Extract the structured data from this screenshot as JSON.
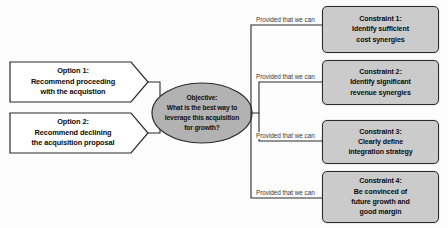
{
  "diagram": {
    "colors": {
      "page_background": "#fdfdfd",
      "objective_fill": "#b2b2b2",
      "constraint_fill": "#cbcbcb",
      "option_fill": "#ffffff",
      "line": "#2a2a2a",
      "text": "#0b0b0b",
      "label_text": "#3a3a3a"
    },
    "options": [
      {
        "id": "option-1",
        "title": "Option 1:",
        "body": "Recommend proceeding\nwith the acquistion",
        "text": "Option 1:\nRecommend proceeding\nwith the acquistion"
      },
      {
        "id": "option-2",
        "title": "Option 2:",
        "body": "Recommend declining\nthe acquisition proposal",
        "text": "Option 2:\nRecommend declining\nthe acquisition proposal"
      }
    ],
    "objective": {
      "id": "objective",
      "title": "Objective:",
      "question": "What is the best way to\nleverage this acquisition\nfor growth?",
      "text": "Objective:\nWhat is the best way to\nleverage this acquisition\nfor growth?"
    },
    "branch_label": "Provided that we can",
    "constraints": [
      {
        "id": "constraint-1",
        "title": "Constraint 1:",
        "body": "Identify sufficient\ncost synergies",
        "text": "Constraint 1:\nIdentify sufficient\ncost synergies",
        "label": "Provided that we can"
      },
      {
        "id": "constraint-2",
        "title": "Constraint 2:",
        "body": "Identify significant\nrevenue synergies",
        "text": "Constraint 2:\nIdentify significant\nrevenue synergies",
        "label": "Provided that we can"
      },
      {
        "id": "constraint-3",
        "title": "Constraint 3:",
        "body": "Clearly define\nintegration strategy",
        "text": "Constraint 3:\nClearly define\nintegration strategy",
        "label": "Provided that we can"
      },
      {
        "id": "constraint-4",
        "title": "Constraint 4:",
        "body": "Be convinced of\nfuture growth and\ngood margin",
        "text": "Constraint 4:\nBe convinced of\nfuture growth and\ngood margin",
        "label": "Provided that we can"
      }
    ]
  }
}
